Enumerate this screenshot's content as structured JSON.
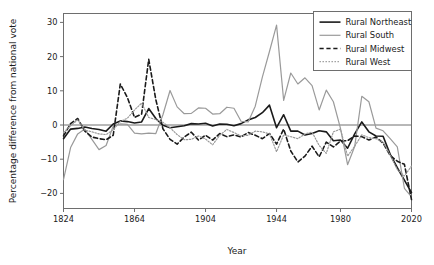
{
  "chart_data": {
    "type": "line",
    "title": "",
    "xlabel": "Year",
    "ylabel": "Percentage difference from national vote",
    "xtick_labels": [
      "1824",
      "1864",
      "1904",
      "1944",
      "1980",
      "2020"
    ],
    "xtick_years": [
      1824,
      1864,
      1904,
      1944,
      1980,
      2020
    ],
    "ytick_labels": [
      "30",
      "20",
      "10",
      "0",
      "−10",
      "−20"
    ],
    "ytick_values": [
      30,
      20,
      10,
      0,
      -10,
      -20
    ],
    "ylim": [
      -25,
      32
    ],
    "xlim": [
      1824,
      2020
    ],
    "grid": false,
    "zero_reference_line": true,
    "legend_position": "top-right",
    "x": [
      1824,
      1828,
      1832,
      1836,
      1840,
      1844,
      1848,
      1852,
      1856,
      1860,
      1864,
      1868,
      1872,
      1876,
      1880,
      1884,
      1888,
      1892,
      1896,
      1900,
      1904,
      1908,
      1912,
      1916,
      1920,
      1924,
      1928,
      1932,
      1936,
      1940,
      1944,
      1948,
      1952,
      1956,
      1960,
      1964,
      1968,
      1972,
      1976,
      1980,
      1984,
      1988,
      1992,
      1996,
      2000,
      2004,
      2008,
      2012,
      2016,
      2020
    ],
    "series": [
      {
        "name": "Rural Northeast",
        "color": "#1a1a1a",
        "dash": "none",
        "width": 1.6,
        "values": [
          -4.0,
          -1.2,
          -1.0,
          -0.6,
          -1.0,
          -1.3,
          -1.8,
          0.3,
          1.2,
          1.0,
          0.6,
          0.9,
          4.8,
          1.9,
          -0.1,
          -0.8,
          -0.5,
          -0.2,
          0.4,
          0.3,
          0.5,
          -0.3,
          0.3,
          0.2,
          -0.2,
          0.4,
          1.5,
          2.2,
          3.6,
          5.8,
          -0.8,
          3.0,
          -1.8,
          -1.8,
          -2.9,
          -2.5,
          -1.7,
          -2.0,
          -4.6,
          -4.4,
          -6.8,
          -2.6,
          0.9,
          -2.0,
          -3.2,
          -3.3,
          -8.6,
          -12.5,
          -16.1,
          -19.8
        ]
      },
      {
        "name": "Rural South",
        "color": "#9a9a9a",
        "dash": "none",
        "width": 1.2,
        "values": [
          -16.0,
          -6.6,
          -2.6,
          -1.2,
          -4.2,
          -7.2,
          -6.0,
          -0.3,
          0.3,
          0.2,
          -2.4,
          -2.6,
          -2.4,
          -2.5,
          3.0,
          10.1,
          5.3,
          3.3,
          3.4,
          5.0,
          4.9,
          3.2,
          3.3,
          5.2,
          4.9,
          1.1,
          0.9,
          5.5,
          14.0,
          21.5,
          29.2,
          7.2,
          15.2,
          12.0,
          13.8,
          11.5,
          4.4,
          10.2,
          6.8,
          -1.0,
          -11.6,
          -6.3,
          8.4,
          6.8,
          -0.9,
          -1.7,
          -4.0,
          -6.4,
          -18.5,
          -21.0
        ]
      },
      {
        "name": "Rural Midwest",
        "color": "#1a1a1a",
        "dash": "dash",
        "width": 1.6,
        "values": [
          -3.2,
          0.4,
          1.9,
          -1.8,
          -3.5,
          -4.0,
          -4.3,
          -3.0,
          12.0,
          8.0,
          2.2,
          3.2,
          19.2,
          7.4,
          -1.1,
          -4.2,
          -5.6,
          -3.5,
          -2.1,
          -4.4,
          -3.0,
          -4.4,
          -2.5,
          -3.4,
          -2.9,
          -3.5,
          -2.2,
          -3.0,
          -4.0,
          -2.5,
          -5.6,
          -1.2,
          -7.6,
          -10.8,
          -9.1,
          -6.2,
          -9.3,
          -5.0,
          -6.4,
          -4.7,
          -4.6,
          -3.2,
          -3.4,
          -4.4,
          -3.5,
          -5.3,
          -8.9,
          -10.6,
          -11.5,
          -21.8
        ]
      },
      {
        "name": "Rural West",
        "color": "#9a9a9a",
        "dash": "dot",
        "width": 1.2,
        "values": [
          -2.2,
          -0.2,
          1.5,
          -1.5,
          -2.0,
          -2.6,
          -2.8,
          -1.4,
          1.0,
          2.0,
          4.4,
          6.4,
          2.2,
          1.6,
          0.8,
          -0.8,
          -2.8,
          -4.3,
          -4.2,
          -3.2,
          -4.1,
          -5.8,
          -3.0,
          -1.3,
          -2.2,
          -3.2,
          -3.0,
          -1.8,
          -2.0,
          -2.6,
          -7.8,
          -2.9,
          -3.4,
          -4.0,
          -2.6,
          -2.1,
          -6.0,
          -8.3,
          -2.0,
          -1.2,
          -9.1,
          -6.2,
          -2.9,
          -3.7,
          -4.0,
          -5.0,
          -8.8,
          -13.0,
          -14.9,
          -12.0
        ]
      }
    ]
  }
}
